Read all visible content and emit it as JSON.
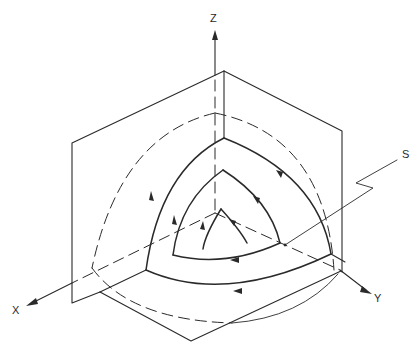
{
  "figure": {
    "type": "3d-coordinate-diagram"
  },
  "axes": {
    "x_label": "X",
    "y_label": "Y",
    "z_label": "Z"
  },
  "surface": {
    "label": "S"
  },
  "loops": [
    {
      "name": "outer-loop",
      "direction": "counterclockwise"
    },
    {
      "name": "middle-loop",
      "direction": "counterclockwise"
    },
    {
      "name": "inner-loop",
      "direction": "counterclockwise"
    }
  ],
  "colors": {
    "line": "#2a2a2a",
    "background": "#ffffff"
  }
}
